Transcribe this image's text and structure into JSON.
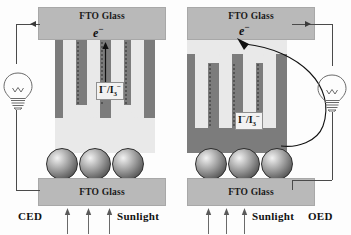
{
  "figure": {
    "background_color": "#fdfdfd"
  },
  "colors": {
    "glass_fill": "#b9b9b9",
    "cell_body_fill": "#7c7c7c",
    "channel_fill": "#e9e9e9",
    "wire": "#4a4a4a",
    "text": "#111111"
  },
  "panels": [
    {
      "id": "ced",
      "caption": "CED",
      "top_glass_label": "FTO Glass",
      "bottom_glass_label": "FTO Glass",
      "electron_label": "e",
      "electron_superscript": "−",
      "redox_label": "I",
      "redox_superscript": "−",
      "redox_separator": "/I",
      "redox_subscript": "3",
      "redox_subscript_superscript": "−",
      "sunlight_label": "Sunlight",
      "sunlight_arrow_count": 3,
      "channel_shape": "W",
      "sphere_count": 3,
      "bulb_position": "left",
      "flow_arrow_direction": "vertical-bidirectional"
    },
    {
      "id": "oed",
      "caption": "OED",
      "top_glass_label": "FTO Glass",
      "bottom_glass_label": "FTO Glass",
      "electron_label": "e",
      "electron_superscript": "−",
      "redox_label": "I",
      "redox_superscript": "−",
      "redox_separator": "/I",
      "redox_subscript": "3",
      "redox_subscript_superscript": "−",
      "sunlight_label": "Sunlight",
      "sunlight_arrow_count": 3,
      "channel_shape": "M",
      "sphere_count": 3,
      "bulb_position": "right",
      "flow_arrow_direction": "curved"
    }
  ]
}
